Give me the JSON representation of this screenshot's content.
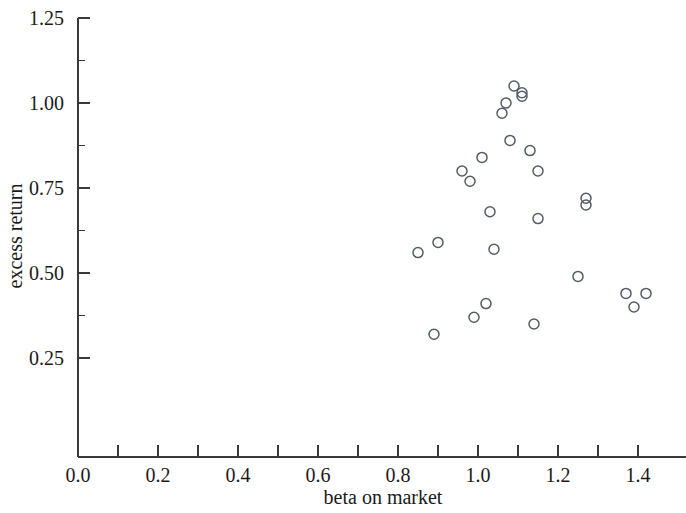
{
  "chart_data": {
    "type": "scatter",
    "title": "",
    "xlabel": "beta on market",
    "ylabel": "excess return",
    "xlim": [
      0.0,
      1.47
    ],
    "ylim": [
      0.15,
      1.25
    ],
    "grid": false,
    "legend": null,
    "marker_style": "open-circle",
    "x_ticks_major": [
      0.0,
      0.2,
      0.4,
      0.6,
      0.8,
      1.0,
      1.2,
      1.4
    ],
    "x_tick_labels": [
      "0.0",
      "0.2",
      "0.4",
      "0.6",
      "0.8",
      "1.0",
      "1.2",
      "1.4"
    ],
    "x_ticks_minor": [
      0.1,
      0.3,
      0.5,
      0.7,
      0.9,
      1.1,
      1.3
    ],
    "y_ticks_major": [
      0.25,
      0.5,
      0.75,
      1.0,
      1.25
    ],
    "y_tick_labels": [
      "0.25",
      "0.50",
      "0.75",
      "1.00",
      "1.25"
    ],
    "y_ticks_minor": [
      0.375,
      0.625,
      0.875,
      1.125
    ],
    "points": [
      {
        "x": 0.85,
        "y": 0.56
      },
      {
        "x": 0.9,
        "y": 0.59
      },
      {
        "x": 0.89,
        "y": 0.32
      },
      {
        "x": 0.96,
        "y": 0.8
      },
      {
        "x": 0.98,
        "y": 0.77
      },
      {
        "x": 1.01,
        "y": 0.84
      },
      {
        "x": 1.03,
        "y": 0.68
      },
      {
        "x": 1.04,
        "y": 0.57
      },
      {
        "x": 1.02,
        "y": 0.41
      },
      {
        "x": 0.99,
        "y": 0.37
      },
      {
        "x": 1.06,
        "y": 0.97
      },
      {
        "x": 1.07,
        "y": 1.0
      },
      {
        "x": 1.09,
        "y": 1.05
      },
      {
        "x": 1.11,
        "y": 1.02
      },
      {
        "x": 1.11,
        "y": 1.03
      },
      {
        "x": 1.08,
        "y": 0.89
      },
      {
        "x": 1.13,
        "y": 0.86
      },
      {
        "x": 1.15,
        "y": 0.8
      },
      {
        "x": 1.15,
        "y": 0.66
      },
      {
        "x": 1.14,
        "y": 0.35
      },
      {
        "x": 1.25,
        "y": 0.49
      },
      {
        "x": 1.27,
        "y": 0.72
      },
      {
        "x": 1.27,
        "y": 0.7
      },
      {
        "x": 1.37,
        "y": 0.44
      },
      {
        "x": 1.39,
        "y": 0.4
      },
      {
        "x": 1.42,
        "y": 0.44
      }
    ]
  }
}
